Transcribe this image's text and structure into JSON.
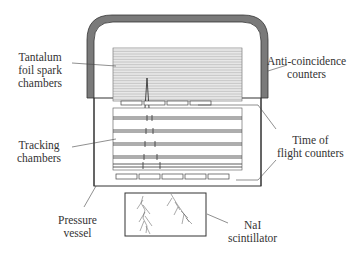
{
  "labels": {
    "spark": {
      "line1": "Tantalum",
      "line2": "foil spark",
      "line3": "chambers"
    },
    "anti": {
      "line1": "Anti-coincidence",
      "line2": "counters"
    },
    "tracking": {
      "line1": "Tracking",
      "line2": "chambers"
    },
    "tof": {
      "line1": "Time of",
      "line2": "flight counters"
    },
    "pressure": {
      "line1": "Pressure",
      "line2": "vessel"
    },
    "nai": {
      "line1": "NaI",
      "line2": "scintillator"
    }
  },
  "colors": {
    "line": "#333333",
    "dome": "#7a7a7a",
    "hatch": "#9a9a9a"
  },
  "components": [
    "anti-coincidence-counters",
    "tantalum-foil-spark-chambers",
    "tracking-chambers",
    "time-of-flight-counters",
    "pressure-vessel",
    "nai-scintillator"
  ]
}
